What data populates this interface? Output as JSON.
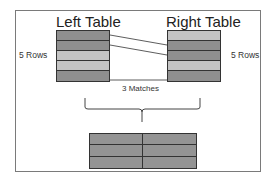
{
  "diagram": {
    "left_table": {
      "title": "Left Table",
      "row_count_label": "5 Rows",
      "rows": [
        "dark",
        "dark",
        "light",
        "light",
        "dark"
      ]
    },
    "right_table": {
      "title": "Right Table",
      "row_count_label": "5 Rows",
      "rows": [
        "light",
        "dark",
        "dark",
        "light",
        "dark"
      ]
    },
    "connections": [
      {
        "from_left_row": 1,
        "to_right_row": 2
      },
      {
        "from_left_row": 2,
        "to_right_row": 3
      },
      {
        "from_left_row": 5,
        "to_right_row": 5
      }
    ],
    "match_label": "3 Matches",
    "result_table": {
      "rows": 3,
      "columns": 2
    },
    "colors": {
      "dark_row": "#8f8f8f",
      "light_row": "#c4c4c4",
      "border": "#333333",
      "frame": "#7a7a7a"
    }
  }
}
